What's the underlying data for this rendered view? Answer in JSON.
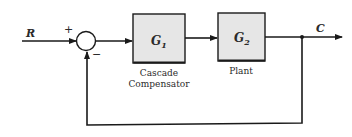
{
  "diagram": {
    "type": "closed-loop block diagram with cascade compensation",
    "input_label": "R",
    "output_label": "C",
    "summing_junction": {
      "plus_sign": "+",
      "minus_sign": "−"
    },
    "blocks": [
      {
        "id": "G1",
        "symbol": "G",
        "subscript": "1",
        "caption_line1": "Cascade",
        "caption_line2": "Compensator"
      },
      {
        "id": "G2",
        "symbol": "G",
        "subscript": "2",
        "caption_line1": "Plant",
        "caption_line2": ""
      }
    ],
    "feedback": "unity negative feedback",
    "colors": {
      "line": "#1a1a1a",
      "block_fill": "#e6e6e6",
      "block_border": "#1a1a1a",
      "background": "#ffffff"
    }
  }
}
